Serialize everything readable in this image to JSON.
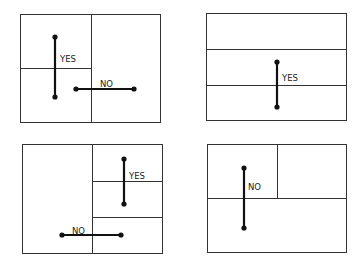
{
  "diagram": {
    "panels": [
      {
        "id": "top-left",
        "box": [
          20,
          14,
          160,
          122
        ],
        "lines": [
          [
            91,
            14,
            91,
            122
          ],
          [
            20,
            68,
            91,
            68
          ]
        ],
        "segments": [
          {
            "label": "YES",
            "x1": 55,
            "y1": 37,
            "x2": 55,
            "y2": 97,
            "lx": 60,
            "ly": 59
          },
          {
            "label": "NO",
            "x1": 76,
            "y1": 89,
            "x2": 134,
            "y2": 89,
            "lx": 100,
            "ly": 84
          }
        ]
      },
      {
        "id": "top-right",
        "box": [
          206,
          13,
          346,
          120
        ],
        "lines": [
          [
            206,
            49,
            346,
            49
          ],
          [
            206,
            85,
            346,
            85
          ]
        ],
        "segments": [
          {
            "label": "YES",
            "x1": 277,
            "y1": 62,
            "x2": 277,
            "y2": 107,
            "lx": 282,
            "ly": 78
          }
        ]
      },
      {
        "id": "bottom-left",
        "box": [
          22,
          144,
          162,
          253
        ],
        "lines": [
          [
            92,
            144,
            92,
            253
          ],
          [
            92,
            181,
            162,
            181
          ],
          [
            92,
            217,
            162,
            217
          ]
        ],
        "segments": [
          {
            "label": "YES",
            "x1": 124,
            "y1": 159,
            "x2": 124,
            "y2": 204,
            "lx": 129,
            "ly": 176
          },
          {
            "label": "NO",
            "x1": 62,
            "y1": 235,
            "x2": 121,
            "y2": 235,
            "lx": 72,
            "ly": 231
          }
        ]
      },
      {
        "id": "bottom-right",
        "box": [
          207,
          144,
          346,
          252
        ],
        "lines": [
          [
            207,
            198,
            346,
            198
          ],
          [
            277,
            144,
            277,
            198
          ]
        ],
        "segments": [
          {
            "label": "NO",
            "x1": 244,
            "y1": 168,
            "x2": 244,
            "y2": 228,
            "lx": 248,
            "ly": 187
          }
        ]
      }
    ]
  }
}
